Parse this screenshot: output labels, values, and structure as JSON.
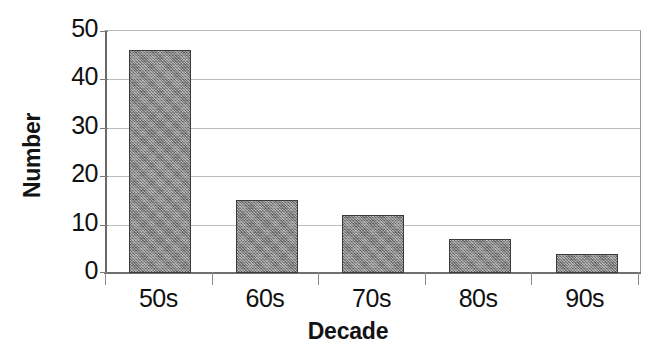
{
  "chart_data": {
    "type": "bar",
    "title": "",
    "xlabel": "Decade",
    "ylabel": "Number",
    "categories": [
      "50s",
      "60s",
      "70s",
      "80s",
      "90s"
    ],
    "values": [
      46,
      15,
      12,
      7,
      4
    ],
    "ylim": [
      0,
      50
    ],
    "y_ticks": [
      0,
      10,
      20,
      30,
      40,
      50
    ],
    "y_tick_labels": [
      "0",
      "10",
      "20",
      "30",
      "40",
      "50"
    ],
    "grid": true,
    "legend": false,
    "legend_position": "none",
    "bar_fill_color": "#8d8d8d",
    "bar_border_color": "#3b3b3b",
    "gridline_color": "#bcbcbc",
    "axis_color": "#6f6f6f",
    "background_color": "#ffffff"
  }
}
